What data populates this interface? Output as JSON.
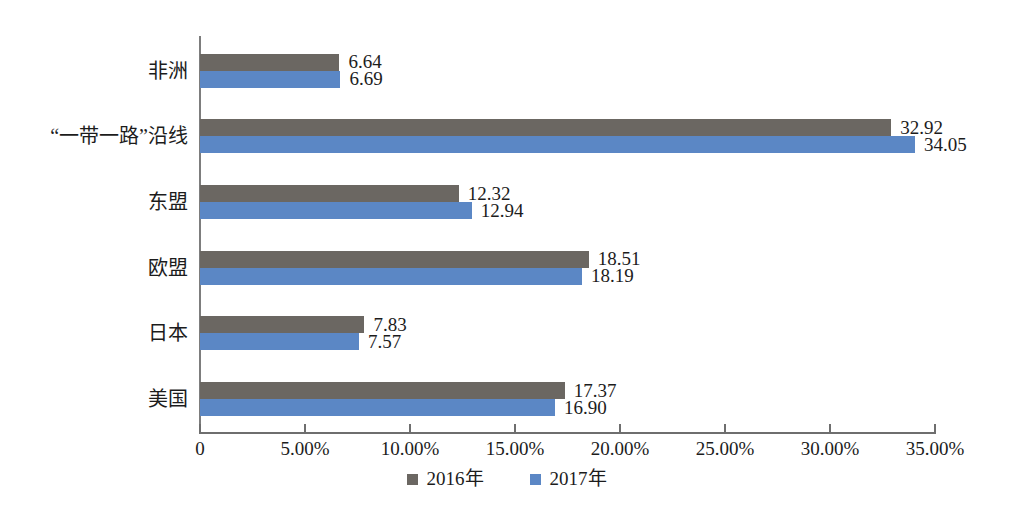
{
  "chart_data": {
    "type": "bar",
    "orientation": "horizontal",
    "title": "",
    "xlabel": "",
    "ylabel": "",
    "xlim": [
      0,
      35
    ],
    "grid": false,
    "legend_position": "bottom-center",
    "categories": [
      "非洲",
      "“一带一路”沿线",
      "东盟",
      "欧盟",
      "日本",
      "美国"
    ],
    "series": [
      {
        "name": "2016年",
        "color": "#6b6762",
        "values": [
          6.64,
          32.92,
          12.32,
          18.51,
          7.83,
          17.37
        ],
        "labels": [
          "6.64",
          "32.92",
          "12.32",
          "18.51",
          "7.83",
          "17.37"
        ]
      },
      {
        "name": "2017年",
        "color": "#5b87c5",
        "values": [
          6.69,
          34.05,
          12.94,
          18.19,
          7.57,
          16.9
        ],
        "labels": [
          "6.69",
          "34.05",
          "12.94",
          "18.19",
          "7.57",
          "16.90"
        ]
      }
    ],
    "x_ticks": [
      {
        "value": 0,
        "label": "0"
      },
      {
        "value": 5,
        "label": "5.00%"
      },
      {
        "value": 10,
        "label": "10.00%"
      },
      {
        "value": 15,
        "label": "15.00%"
      },
      {
        "value": 20,
        "label": "20.00%"
      },
      {
        "value": 25,
        "label": "25.00%"
      },
      {
        "value": 30,
        "label": "30.00%"
      },
      {
        "value": 35,
        "label": "35.00%"
      }
    ]
  },
  "legend": {
    "items": [
      {
        "label": "2016年",
        "color": "#6b6762"
      },
      {
        "label": "2017年",
        "color": "#5b87c5"
      }
    ]
  }
}
